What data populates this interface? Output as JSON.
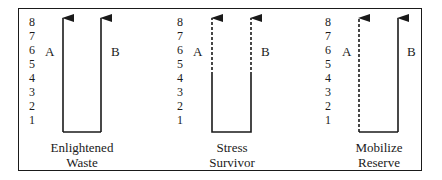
{
  "diagram": {
    "scale": [
      "8",
      "7",
      "6",
      "5",
      "4",
      "3",
      "2",
      "1"
    ],
    "panels": [
      {
        "id": "enlightened-waste",
        "caption_line1": "Enlightened",
        "caption_line2": "Waste",
        "left_label": "A",
        "right_label": "B",
        "left_line": "solid",
        "right_line": "solid"
      },
      {
        "id": "stress-survivor",
        "caption_line1": "Stress",
        "caption_line2": "Survivor",
        "left_label": "A",
        "right_label": "B",
        "left_line": "dashed-upper-solid-lower",
        "right_line": "dashed-upper-solid-lower"
      },
      {
        "id": "mobilize-reserve",
        "caption_line1": "Mobilize",
        "caption_line2": "Reserve",
        "left_label": "A",
        "right_label": "B",
        "left_line": "dashed",
        "right_line": "solid"
      }
    ],
    "line_color": "#1a1a1a"
  }
}
